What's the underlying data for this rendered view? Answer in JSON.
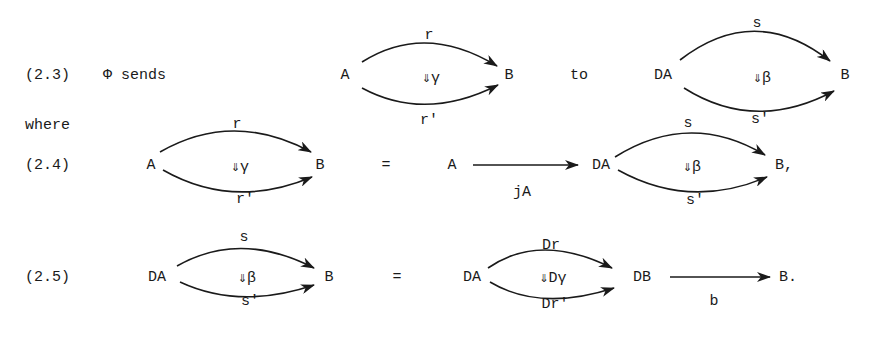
{
  "eq_2_3": {
    "number": "(2.3)",
    "text": "Φ sends",
    "source_diagram": {
      "domain": "A",
      "codomain": "B",
      "top_arrow": "r",
      "bottom_arrow": "r'",
      "two_cell": "⇓γ"
    },
    "connector": "to",
    "target_diagram": {
      "domain": "DA",
      "codomain": "B",
      "top_arrow": "s",
      "bottom_arrow": "s'",
      "two_cell": "⇓β"
    }
  },
  "where": "where",
  "eq_2_4": {
    "number": "(2.4)",
    "lhs": {
      "domain": "A",
      "codomain": "B",
      "top_arrow": "r",
      "bottom_arrow": "r'",
      "two_cell": "⇓γ"
    },
    "equals": "=",
    "rhs": {
      "first_object": "A",
      "first_arrow": "jA",
      "domain": "DA",
      "codomain": "B,",
      "top_arrow": "s",
      "bottom_arrow": "s'",
      "two_cell": "⇓β"
    }
  },
  "eq_2_5": {
    "number": "(2.5)",
    "lhs": {
      "domain": "DA",
      "codomain": "B",
      "top_arrow": "s",
      "bottom_arrow": "s'",
      "two_cell": "⇓β"
    },
    "equals": "=",
    "rhs": {
      "domain": "DA",
      "codomain": "DB",
      "top_arrow": "Dr",
      "bottom_arrow": "Dr'",
      "two_cell": "⇓Dγ",
      "last_arrow": "b",
      "last_object": "B."
    }
  }
}
